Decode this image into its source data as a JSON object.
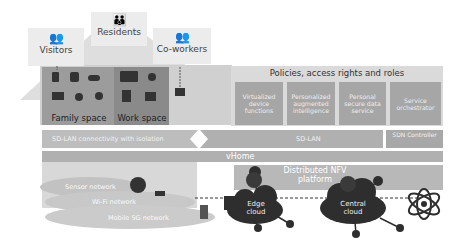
{
  "roles": {
    "visitors": "Visitors",
    "residents": "Residents",
    "coworkers": "Co-workers"
  },
  "spaces": {
    "family": "Family space",
    "work": "Work space"
  },
  "policies": {
    "title": "Policies, access rights and roles",
    "services": [
      "Virtualized device functions",
      "Personalized augmented intelligence",
      "Personal secure data service",
      "Service orchestrator"
    ]
  },
  "bars": {
    "sdlan_isolation": "SD-LAN connectivity with isolation",
    "sdlan": "SD-LAN",
    "sdn_controller": "SDN Controller",
    "vhome": "vHome",
    "nfv": "Distributed NFV platform"
  },
  "networks": {
    "sensor": "Sensor network",
    "wifi": "Wi-Fi network",
    "mobile": "Mobile 5G network"
  },
  "clouds": {
    "edge": "Edge cloud",
    "central": "Central cloud"
  },
  "colors": {
    "roof": "#d2d2d2",
    "family": "#9a9a9a",
    "work": "#888888",
    "panel": "#c4c4c4",
    "service": "#a6a6a6",
    "bar": "#b0b0b0",
    "cloud_dark": "#2e2e2e",
    "network_cloud": "#c8c8c8"
  }
}
